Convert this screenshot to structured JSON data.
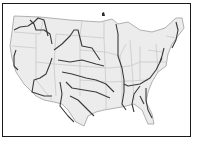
{
  "map": {
    "title": "Major rivers of the contiguous United States",
    "colors": {
      "land": "#ececec",
      "state_border": "#bdbdbd",
      "coast": "#b0b0b0",
      "river": "#3a3a3a",
      "frame": "#1a1a1a"
    }
  }
}
